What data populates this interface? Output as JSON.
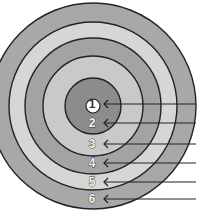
{
  "diagram": {
    "type": "concentric-target",
    "center": {
      "x": 93,
      "y": 106
    },
    "rings": [
      {
        "label": "6",
        "radius": 103,
        "fill": "#a8a8a8",
        "label_y": 199
      },
      {
        "label": "5",
        "radius": 84,
        "fill": "#d6d6d6",
        "label_y": 182
      },
      {
        "label": "4",
        "radius": 68,
        "fill": "#a3a3a3",
        "label_y": 163
      },
      {
        "label": "3",
        "radius": 50,
        "fill": "#c9c9c9",
        "label_y": 144
      },
      {
        "label": "2",
        "radius": 28,
        "fill": "#8c8c8c",
        "label_y": 123
      },
      {
        "label": "1",
        "radius": 7,
        "fill": "#ffffff",
        "label_y": 104
      }
    ],
    "line_color": "#222222",
    "arrow_end_x": 196
  }
}
